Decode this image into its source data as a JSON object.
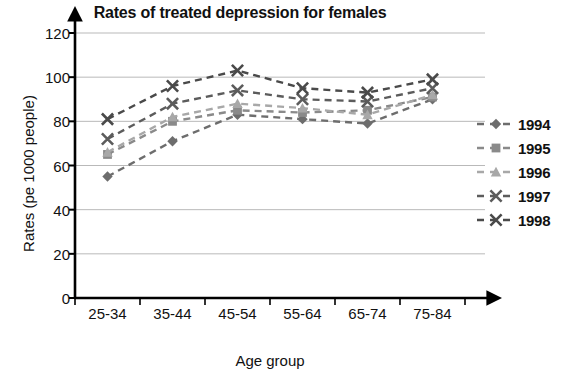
{
  "chart_data": {
    "type": "line",
    "title": "Rates of treated depression for females",
    "xlabel": "Age group",
    "ylabel": "Rates (pe 1000 people)",
    "categories": [
      "25-34",
      "35-44",
      "45-54",
      "55-64",
      "65-74",
      "75-84"
    ],
    "ylim": [
      0,
      120
    ],
    "yticks": [
      0,
      20,
      40,
      60,
      80,
      100,
      120
    ],
    "grid": true,
    "legend_position": "right",
    "series": [
      {
        "name": "1994",
        "marker": "diamond",
        "color": "#6d6d6d",
        "values": [
          55,
          71,
          83,
          81,
          79,
          90
        ]
      },
      {
        "name": "1995",
        "marker": "square",
        "color": "#8a8a8a",
        "values": [
          65,
          80,
          85,
          84,
          85,
          91
        ]
      },
      {
        "name": "1996",
        "marker": "triangle",
        "color": "#a8a8a8",
        "values": [
          66,
          82,
          88,
          86,
          83,
          92
        ]
      },
      {
        "name": "1997",
        "marker": "x",
        "color": "#5c5c5c",
        "values": [
          72,
          88,
          94,
          90,
          89,
          95
        ]
      },
      {
        "name": "1998",
        "marker": "x",
        "color": "#4a4a4a",
        "values": [
          81,
          96,
          103,
          95,
          93,
          99
        ]
      }
    ]
  },
  "legend": {
    "items": [
      {
        "label": "1994"
      },
      {
        "label": "1995"
      },
      {
        "label": "1996"
      },
      {
        "label": "1997"
      },
      {
        "label": "1998"
      }
    ]
  }
}
